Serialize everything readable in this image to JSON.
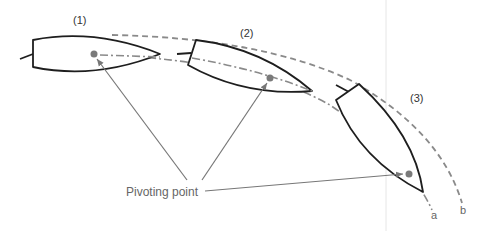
{
  "diagram": {
    "positions": [
      {
        "id": 1,
        "label": "(1)"
      },
      {
        "id": 2,
        "label": "(2)"
      },
      {
        "id": 3,
        "label": "(3)"
      }
    ],
    "annotation": {
      "label": "Pivoting point"
    },
    "paths": {
      "a": {
        "label": "a",
        "style": "dash-dot",
        "description": "path of pivoting point"
      },
      "b": {
        "label": "b",
        "style": "dashed",
        "description": "path of bow outer edge"
      }
    },
    "colors": {
      "hull_outline": "#1e1e1e",
      "path_lines": "#8a8a8a",
      "pivot_dot": "#7a7a7a",
      "arrows": "#777777",
      "background": "#ffffff",
      "divider": "#e6e6e6"
    }
  }
}
